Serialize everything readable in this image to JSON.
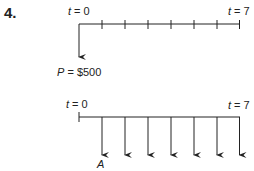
{
  "problem_number": "4.",
  "top_timeline": {
    "start_label": {
      "var": "t",
      "eq": " = 0"
    },
    "end_label": {
      "var": "t",
      "eq": " = 7"
    },
    "periods": 7,
    "cash_flow": {
      "var": "P",
      "eq": " = $500"
    }
  },
  "bottom_timeline": {
    "start_label": {
      "var": "t",
      "eq": " = 0"
    },
    "end_label": {
      "var": "t",
      "eq": " = 7"
    },
    "periods": 7,
    "cash_flow": {
      "var": "A"
    }
  },
  "colors": {
    "line": "#222222"
  }
}
